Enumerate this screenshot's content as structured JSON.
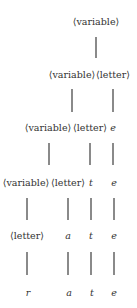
{
  "diagram": {
    "colors": {
      "text": "#333333",
      "edge": "#8a8a8a",
      "background": "#ffffff"
    },
    "rows": [
      {
        "y": 17,
        "nodes": [
          {
            "label": "⟨variable⟩",
            "x": 96,
            "italic": false
          }
        ]
      },
      {
        "y": 70,
        "nodes": [
          {
            "label": "⟨variable⟩",
            "x": 72,
            "italic": false
          },
          {
            "label": "⟨letter⟩",
            "x": 113,
            "italic": false
          }
        ]
      },
      {
        "y": 123,
        "nodes": [
          {
            "label": "⟨variable⟩",
            "x": 48,
            "italic": false
          },
          {
            "label": "⟨letter⟩",
            "x": 90,
            "italic": false
          },
          {
            "label": "e",
            "x": 113,
            "italic": true
          }
        ]
      },
      {
        "y": 178,
        "nodes": [
          {
            "label": "⟨variable⟩",
            "x": 26,
            "italic": false
          },
          {
            "label": "⟨letter⟩",
            "x": 68,
            "italic": false
          },
          {
            "label": "t",
            "x": 91,
            "italic": true
          },
          {
            "label": "e",
            "x": 114,
            "italic": true
          }
        ]
      },
      {
        "y": 231,
        "nodes": [
          {
            "label": "⟨letter⟩",
            "x": 27,
            "italic": false
          },
          {
            "label": "a",
            "x": 68,
            "italic": true
          },
          {
            "label": "t",
            "x": 91,
            "italic": true
          },
          {
            "label": "e",
            "x": 114,
            "italic": true
          }
        ]
      },
      {
        "y": 288,
        "nodes": [
          {
            "label": "r",
            "x": 28,
            "italic": true
          },
          {
            "label": "a",
            "x": 69,
            "italic": true
          },
          {
            "label": "t",
            "x": 92,
            "italic": true
          },
          {
            "label": "e",
            "x": 114,
            "italic": true
          }
        ]
      }
    ],
    "edges": [
      {
        "x": 96,
        "y1": 37,
        "y2": 58
      },
      {
        "x": 72,
        "y1": 89,
        "y2": 112
      },
      {
        "x": 113,
        "y1": 89,
        "y2": 112
      },
      {
        "x": 49,
        "y1": 143,
        "y2": 165
      },
      {
        "x": 90,
        "y1": 143,
        "y2": 165
      },
      {
        "x": 113,
        "y1": 143,
        "y2": 165
      },
      {
        "x": 27,
        "y1": 198,
        "y2": 220
      },
      {
        "x": 68,
        "y1": 198,
        "y2": 220
      },
      {
        "x": 91,
        "y1": 198,
        "y2": 220
      },
      {
        "x": 114,
        "y1": 198,
        "y2": 220
      },
      {
        "x": 27,
        "y1": 252,
        "y2": 275
      },
      {
        "x": 68,
        "y1": 252,
        "y2": 275
      },
      {
        "x": 91,
        "y1": 252,
        "y2": 275
      },
      {
        "x": 114,
        "y1": 252,
        "y2": 275
      }
    ]
  }
}
